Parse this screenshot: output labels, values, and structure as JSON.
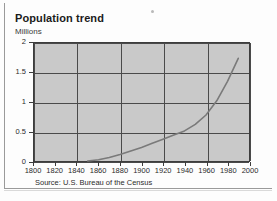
{
  "chart_data": {
    "type": "line",
    "title": "Population trend",
    "ylabel": "Millions",
    "xlabel": "",
    "source": "Source: U.S. Bureau of the Census",
    "xlim": [
      1800,
      2000
    ],
    "ylim": [
      0,
      2
    ],
    "grid": true,
    "legend": "none",
    "y_ticks": [
      "0",
      "0.5",
      "1",
      "1.5",
      "2"
    ],
    "y_tick_values": [
      0,
      0.5,
      1,
      1.5,
      2
    ],
    "x_ticks": [
      "1800",
      "1820",
      "1840",
      "1860",
      "1880",
      "1900",
      "1920",
      "1940",
      "1960",
      "1980",
      "2000"
    ],
    "x_tick_values": [
      1800,
      1820,
      1840,
      1860,
      1880,
      1900,
      1920,
      1940,
      1960,
      1980,
      2000
    ],
    "gridlines_x": [
      1800,
      1840,
      1880,
      1920,
      1960,
      2000
    ],
    "gridlines_y": [
      0,
      0.5,
      1,
      1.5,
      2
    ],
    "series": [
      {
        "name": "Population",
        "x": [
          1850,
          1860,
          1870,
          1880,
          1890,
          1900,
          1910,
          1920,
          1930,
          1940,
          1950,
          1960,
          1970,
          1980,
          1990
        ],
        "values": [
          0.0,
          0.02,
          0.06,
          0.11,
          0.17,
          0.23,
          0.3,
          0.37,
          0.44,
          0.51,
          0.62,
          0.78,
          1.02,
          1.35,
          1.74
        ]
      }
    ],
    "colors": {
      "plot_background": "#c9c9c9",
      "grid": "#4a4a4a",
      "line": "#7a7a7a",
      "axis_text": "#2b2b2b",
      "title": "#1b1b1b"
    }
  },
  "frame": {
    "speck_name": "page-speck"
  }
}
